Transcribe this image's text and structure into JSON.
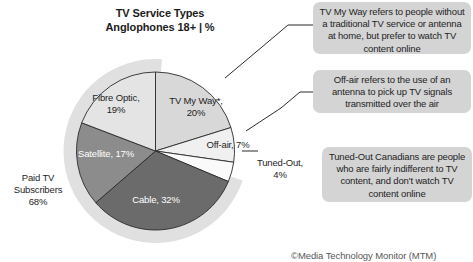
{
  "chart_data": {
    "type": "pie",
    "title": "TV Service Types",
    "subtitle": "Anglophones 18+ | %",
    "categories": [
      "TV My Way*",
      "Off-air",
      "Tuned-Out",
      "Cable",
      "Satellite",
      "Fibre Optic"
    ],
    "values": [
      20,
      7,
      4,
      32,
      17,
      19
    ],
    "unit": "%",
    "labels": [
      "TV My Way*, 20%",
      "Off-air, 7%",
      "Tuned-Out, 4%",
      "Cable, 32%",
      "Satellite, 17%",
      "Fibre Optic, 19%"
    ],
    "colors": [
      "#d8d8d8",
      "#f0f0f0",
      "#fafafa",
      "#6b6b6b",
      "#8c8c8c",
      "#e4e4e4"
    ],
    "group_annotation": {
      "name": "Paid TV Subscribers",
      "value": 68,
      "members": [
        "Cable",
        "Satellite",
        "Fibre Optic"
      ],
      "halo_color": "#e0e0e0"
    },
    "legend": "none",
    "grid": false,
    "start_angle_deg": 0,
    "direction": "clockwise"
  },
  "title": {
    "line1": "TV Service Types",
    "line2": "Anglophones 18+ | %"
  },
  "slices": [
    {
      "name": "fibre-optic",
      "label": "Fibre Optic,",
      "value_label": "19%",
      "color": "#e4e4e4"
    },
    {
      "name": "tv-my-way",
      "label": "TV My Way*,",
      "value_label": "20%",
      "color": "#d8d8d8"
    },
    {
      "name": "satellite",
      "label": "Satellite, 17%",
      "value_label": "",
      "color": "#8c8c8c"
    },
    {
      "name": "cable",
      "label": "Cable, 32%",
      "value_label": "",
      "color": "#6b6b6b"
    },
    {
      "name": "off-air",
      "label": "Off-air, 7%",
      "value_label": "",
      "color": "#f0f0f0"
    },
    {
      "name": "tuned-out",
      "label": "Tuned-Out,",
      "value_label": "4%",
      "color": "#fafafa"
    }
  ],
  "paid_tv": {
    "line1": "Paid TV",
    "line2": "Subscribers",
    "line3": "68%"
  },
  "callouts": [
    {
      "name": "tv-my-way",
      "text": "TV My Way refers to people without a traditional TV service or antenna at home, but prefer to watch TV content online"
    },
    {
      "name": "off-air",
      "text": "Off-air refers to the use of an antenna to pick up TV signals transmitted over the air"
    },
    {
      "name": "tuned-out",
      "text": "Tuned-Out Canadians are people who are fairly indifferent to TV content, and don't watch TV content online"
    }
  ],
  "footer": {
    "credit": "©Media Technology Monitor (MTM)"
  }
}
